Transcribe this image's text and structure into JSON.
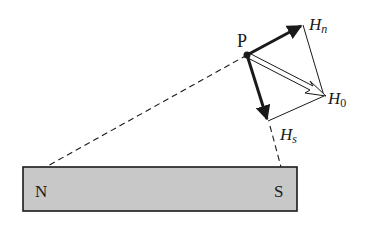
{
  "diagram": {
    "point_label": "P",
    "magnet": {
      "north_label": "N",
      "south_label": "S",
      "fill": "#c8c8c8",
      "stroke": "#1a1a1a"
    },
    "vectors": {
      "Hn": {
        "main": "H",
        "sub": "n"
      },
      "Hs": {
        "main": "H",
        "sub": "s"
      },
      "H0": {
        "main": "H",
        "sub": "0"
      }
    },
    "colors": {
      "ink": "#1a1a1a",
      "background": "#ffffff"
    }
  }
}
